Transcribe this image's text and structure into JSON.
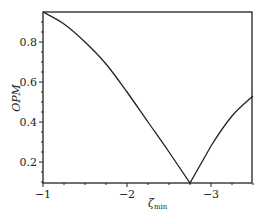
{
  "chart_data": {
    "type": "line",
    "title": "",
    "xlabel": "ζmin",
    "ylabel": "OPM",
    "xlim": [
      -1,
      -3.5
    ],
    "ylim": [
      0.095,
      0.95
    ],
    "xticks": [
      "-1",
      "-2",
      "-3"
    ],
    "yticks": [
      "0.2",
      "0.4",
      "0.6",
      "0.8"
    ],
    "grid": false,
    "legend": null,
    "series": [
      {
        "name": "OPM",
        "x": [
          -1.0,
          -1.25,
          -1.5,
          -1.75,
          -2.0,
          -2.25,
          -2.5,
          -2.75,
          -3.0,
          -3.25,
          -3.5
        ],
        "y": [
          0.95,
          0.89,
          0.8,
          0.69,
          0.55,
          0.4,
          0.25,
          0.095,
          0.28,
          0.43,
          0.53
        ]
      }
    ]
  },
  "axes": {
    "x_label_main": "ζ",
    "x_label_sub": "min",
    "y_label": "OPM"
  }
}
